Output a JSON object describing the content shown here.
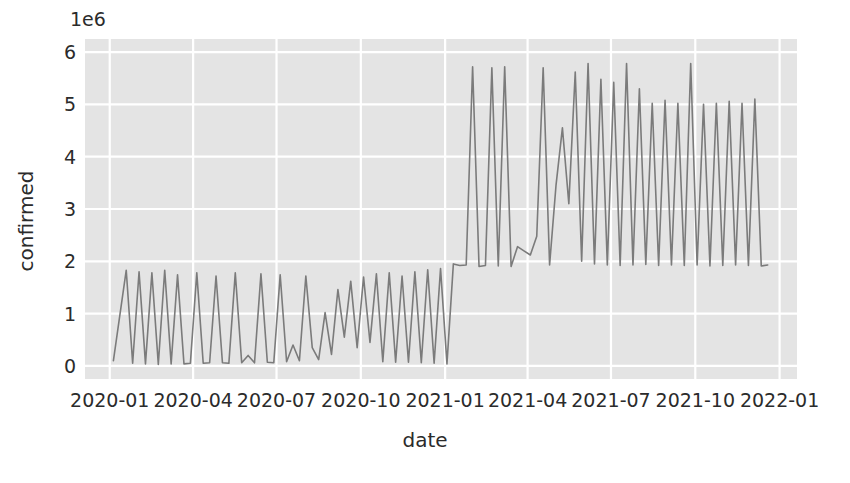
{
  "chart_data": {
    "type": "line",
    "title": "",
    "xlabel": "date",
    "ylabel": "confirmed",
    "y_offset_label": "1e6",
    "y_offset_multiplier": 1000000,
    "grid": true,
    "legend": null,
    "xlim": [
      "2019-12-05",
      "2022-01-20"
    ],
    "ylim": [
      -0.25,
      6.25
    ],
    "ytick_labels": [
      "0",
      "1",
      "2",
      "3",
      "4",
      "5",
      "6"
    ],
    "ytick_values": [
      0,
      1,
      2,
      3,
      4,
      5,
      6
    ],
    "xtick_labels": [
      "2020-01",
      "2020-04",
      "2020-07",
      "2020-10",
      "2021-01",
      "2021-04",
      "2021-07",
      "2021-10",
      "2022-01"
    ],
    "xtick_dates": [
      "2020-01-01",
      "2020-04-01",
      "2020-07-01",
      "2020-10-01",
      "2021-01-01",
      "2021-04-01",
      "2021-07-01",
      "2021-10-01",
      "2022-01-01"
    ],
    "colors": {
      "line": "#7b7b7b",
      "plot_background": "#e4e4e4",
      "gridline": "#ffffff",
      "figure_background": "#ffffff",
      "text": "#2b2b2b"
    },
    "series": [
      {
        "name": "confirmed",
        "x": [
          "2020-01-05",
          "2020-01-19",
          "2020-01-26",
          "2020-02-02",
          "2020-02-09",
          "2020-02-16",
          "2020-02-23",
          "2020-03-01",
          "2020-03-08",
          "2020-03-15",
          "2020-03-22",
          "2020-03-29",
          "2020-04-05",
          "2020-04-12",
          "2020-04-19",
          "2020-04-26",
          "2020-05-03",
          "2020-05-10",
          "2020-05-17",
          "2020-05-24",
          "2020-05-31",
          "2020-06-07",
          "2020-06-14",
          "2020-06-21",
          "2020-06-28",
          "2020-07-05",
          "2020-07-12",
          "2020-07-19",
          "2020-07-26",
          "2020-08-02",
          "2020-08-09",
          "2020-08-16",
          "2020-08-23",
          "2020-08-30",
          "2020-09-06",
          "2020-09-13",
          "2020-09-20",
          "2020-09-27",
          "2020-10-04",
          "2020-10-11",
          "2020-10-18",
          "2020-10-25",
          "2020-11-01",
          "2020-11-08",
          "2020-11-15",
          "2020-11-22",
          "2020-11-29",
          "2020-12-06",
          "2020-12-13",
          "2020-12-20",
          "2020-12-27",
          "2021-01-03",
          "2021-01-10",
          "2021-01-17",
          "2021-01-24",
          "2021-01-31",
          "2021-02-07",
          "2021-02-14",
          "2021-02-21",
          "2021-02-28",
          "2021-03-07",
          "2021-03-14",
          "2021-03-21",
          "2021-03-28",
          "2021-04-04",
          "2021-04-11",
          "2021-04-18",
          "2021-04-25",
          "2021-05-02",
          "2021-05-09",
          "2021-05-16",
          "2021-05-23",
          "2021-05-30",
          "2021-06-06",
          "2021-06-13",
          "2021-06-20",
          "2021-06-27",
          "2021-07-04",
          "2021-07-11",
          "2021-07-18",
          "2021-07-25",
          "2021-08-01",
          "2021-08-08",
          "2021-08-15",
          "2021-08-22",
          "2021-08-29",
          "2021-09-05",
          "2021-09-12",
          "2021-09-19",
          "2021-09-26",
          "2021-10-03",
          "2021-10-10",
          "2021-10-17",
          "2021-10-24",
          "2021-10-31",
          "2021-11-07",
          "2021-11-14",
          "2021-11-21",
          "2021-11-28",
          "2021-12-05",
          "2021-12-12",
          "2021-12-19"
        ],
        "y": [
          0.1,
          1.83,
          0.05,
          1.8,
          0.04,
          1.78,
          0.03,
          1.83,
          0.04,
          1.74,
          0.04,
          0.05,
          1.78,
          0.05,
          0.06,
          1.72,
          0.06,
          0.05,
          1.78,
          0.06,
          0.2,
          0.06,
          1.76,
          0.07,
          0.06,
          1.74,
          0.08,
          0.4,
          0.1,
          1.72,
          0.35,
          0.12,
          1.02,
          0.22,
          1.46,
          0.55,
          1.62,
          0.35,
          1.7,
          0.45,
          1.76,
          0.08,
          1.78,
          0.07,
          1.72,
          0.07,
          1.8,
          0.06,
          1.84,
          0.05,
          1.86,
          0.04,
          1.95,
          1.92,
          1.93,
          5.72,
          1.9,
          1.92,
          5.7,
          1.91,
          5.72,
          1.9,
          2.28,
          2.2,
          2.12,
          2.48,
          5.7,
          1.93,
          3.45,
          4.55,
          3.1,
          5.62,
          2.0,
          5.78,
          1.95,
          5.48,
          1.93,
          5.42,
          1.92,
          5.78,
          1.93,
          5.3,
          1.94,
          5.02,
          1.92,
          5.08,
          1.93,
          5.02,
          1.92,
          5.78,
          1.93,
          5.0,
          1.91,
          5.02,
          1.92,
          5.06,
          1.93,
          5.02,
          1.92,
          5.1,
          1.91,
          1.93
        ]
      }
    ]
  }
}
